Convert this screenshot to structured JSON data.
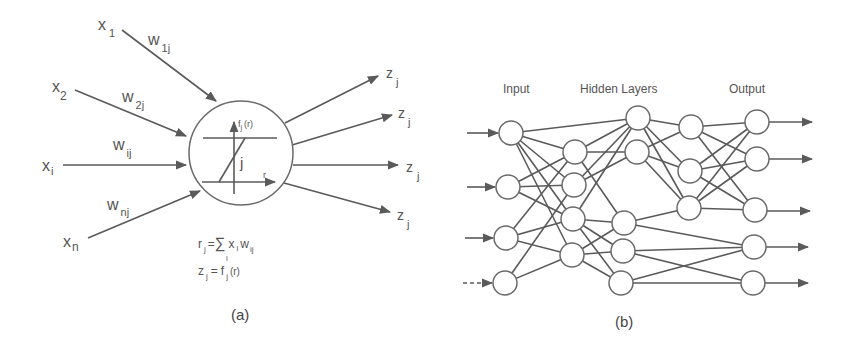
{
  "colors": {
    "ink": "#5a5a5a",
    "background": "#ffffff"
  },
  "panel_a": {
    "caption": "(a)",
    "inputs": [
      {
        "x": "x",
        "x_sub": "1",
        "w": "w",
        "w_sub": "1j"
      },
      {
        "x": "x",
        "x_sub": "2",
        "w": "w",
        "w_sub": "2j"
      },
      {
        "x": "x",
        "x_sub": "i",
        "w": "w",
        "w_sub": "ij"
      },
      {
        "x": "x",
        "x_sub": "n",
        "w": "w",
        "w_sub": "nj"
      }
    ],
    "outputs": [
      {
        "z": "z",
        "z_sub": "j"
      },
      {
        "z": "z",
        "z_sub": "j"
      },
      {
        "z": "z",
        "z_sub": "j"
      },
      {
        "z": "z",
        "z_sub": "j"
      }
    ],
    "neuron": {
      "label": "j",
      "fn_label": "f",
      "fn_sub": "j",
      "fn_arg": "(r)",
      "axis_label": "r"
    },
    "formula_1": {
      "lhs": "r",
      "lhs_sub": "j",
      "eq": "=",
      "sum": "∑",
      "sum_sub": "i",
      "x": "x",
      "x_sub": "i",
      "w": "w",
      "w_sub": "ij"
    },
    "formula_2": {
      "lhs": "z",
      "lhs_sub": "j",
      "eq": "=",
      "f": "f",
      "f_sub": "j",
      "arg": "(r)"
    }
  },
  "panel_b": {
    "caption": "(b)",
    "layer_labels": {
      "input": "Input",
      "hidden": "Hidden Layers",
      "output": "Output"
    },
    "layers": {
      "input": 4,
      "hidden_1": 4,
      "hidden_2": 5,
      "hidden_3": 3,
      "output": 5
    }
  }
}
